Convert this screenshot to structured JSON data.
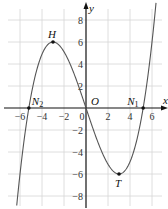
{
  "chart_data": {
    "type": "line",
    "title": "",
    "xlabel": "x",
    "ylabel": "y",
    "xlim": [
      -7.0,
      7.2
    ],
    "ylim": [
      -9.2,
      9.8
    ],
    "grid": true,
    "grid_step": 2,
    "x_ticks": [
      -6,
      -4,
      -2,
      0,
      2,
      4,
      6
    ],
    "y_ticks": [
      -8,
      -6,
      -4,
      -2,
      2,
      4,
      6,
      8
    ],
    "function": "y = (x^3 - 27x) / 9",
    "series": [
      {
        "name": "f(x)",
        "x": [
          -6.5,
          -6,
          -5.5,
          -5.196,
          -5,
          -4.5,
          -4,
          -3.5,
          -3,
          -2.5,
          -2,
          -1.5,
          -1,
          -0.5,
          0,
          0.5,
          1,
          1.5,
          2,
          2.5,
          3,
          3.5,
          4,
          4.5,
          5,
          5.196,
          5.5,
          6,
          6.5
        ],
        "y": [
          -11.0,
          -6.0,
          -2.24,
          0,
          0.89,
          3.38,
          4.89,
          5.74,
          6.0,
          5.76,
          5.11,
          4.13,
          2.89,
          1.49,
          0,
          -1.49,
          -2.89,
          -4.13,
          -5.11,
          -5.76,
          -6.0,
          -5.74,
          -4.89,
          -3.38,
          -0.89,
          0,
          2.24,
          6.0,
          11.0
        ]
      }
    ],
    "points": [
      {
        "label": "H",
        "x": -3,
        "y": 6
      },
      {
        "label": "T",
        "x": 3,
        "y": -6
      },
      {
        "label": "O",
        "x": 0,
        "y": 0
      },
      {
        "label": "N1",
        "x": 5.196,
        "y": 0
      },
      {
        "label": "N2",
        "x": -5.196,
        "y": 0
      }
    ],
    "annotations": [
      "H",
      "T",
      "O",
      "N1",
      "N2"
    ]
  },
  "labels": {
    "x_axis": "x",
    "y_axis": "y",
    "origin": "O",
    "H": "H",
    "T": "T",
    "N1": "N",
    "N1_sub": "1",
    "N2": "N",
    "N2_sub": "2",
    "zero": "0"
  },
  "colors": {
    "grid": "#d6d6d6",
    "axis": "#111111",
    "curve": "#555555",
    "point": "#111111"
  }
}
